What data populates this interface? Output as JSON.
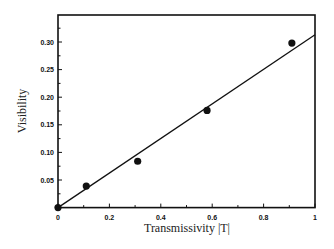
{
  "chart_data": {
    "type": "scatter",
    "title": "",
    "xlabel": "Transmissivity |T|",
    "ylabel": "Visibility",
    "xlim": [
      0,
      1
    ],
    "ylim": [
      0,
      0.34
    ],
    "grid": false,
    "legend": null,
    "x_ticks": [
      "0",
      "0.2",
      "0.4",
      "0.6",
      "0.8",
      "1"
    ],
    "y_ticks": [
      "0.05",
      "0.10",
      "0.15",
      "0.20",
      "0.25",
      "0.30"
    ],
    "series": [
      {
        "name": "measured",
        "kind": "scatter",
        "x": [
          0.0,
          0.11,
          0.31,
          0.58,
          0.91
        ],
        "y": [
          0.0,
          0.039,
          0.084,
          0.176,
          0.298
        ]
      },
      {
        "name": "linear fit",
        "kind": "line",
        "x": [
          0.0,
          1.0
        ],
        "y": [
          0.0,
          0.313
        ]
      }
    ]
  }
}
